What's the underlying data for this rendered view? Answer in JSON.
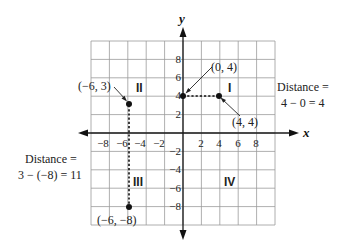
{
  "diagram": {
    "type": "coordinate-plane",
    "axes": {
      "x_label": "x",
      "y_label": "y",
      "range": [
        -10,
        10
      ],
      "tick_step": 2,
      "x_ticks": [
        "−8",
        "−6",
        "−4",
        "−2",
        "2",
        "4",
        "6",
        "8"
      ],
      "y_ticks_pos": [
        "8",
        "6",
        "4",
        "2"
      ],
      "y_ticks_neg": [
        "−2",
        "−4",
        "−6",
        "−8"
      ]
    },
    "quadrants": {
      "I": "I",
      "II": "II",
      "III": "III",
      "IV": "IV"
    },
    "points": [
      {
        "label": "(−6, 3)",
        "x": -6,
        "y": 3
      },
      {
        "label": "(0, 4)",
        "x": 0,
        "y": 4
      },
      {
        "label": "(4, 4)",
        "x": 4,
        "y": 4
      },
      {
        "label": "(−6, −8)",
        "x": -6,
        "y": -8
      }
    ],
    "segments": [
      {
        "from": [
          0,
          4
        ],
        "to": [
          4,
          4
        ],
        "style": "dashed"
      },
      {
        "from": [
          -6,
          3
        ],
        "to": [
          -6,
          -8
        ],
        "style": "dashed"
      }
    ],
    "annotations": {
      "right": {
        "line1": "Distance =",
        "line2": "4 − 0 = 4"
      },
      "left": {
        "line1": "Distance =",
        "line2": "3 − (−8) = 11"
      }
    }
  }
}
